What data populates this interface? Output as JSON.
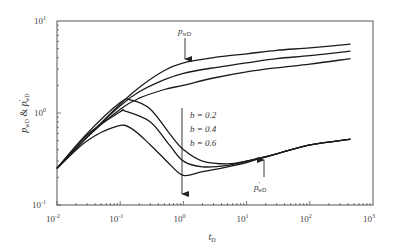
{
  "chart_data": {
    "type": "line",
    "title": "",
    "xlabel": "t_D",
    "ylabel": "p_wD & p'_wD",
    "xscale": "log",
    "yscale": "log",
    "xlim": [
      0.01,
      1000
    ],
    "ylim": [
      0.1,
      10
    ],
    "x_ticks": [
      "10^-2",
      "10^-1",
      "10^0",
      "10^1",
      "10^2",
      "10^3"
    ],
    "y_ticks": [
      "10^-1",
      "10^0",
      "10^1"
    ],
    "grid": false,
    "legend": "none",
    "annotations": [
      {
        "text": "p_wD",
        "points_to": "pressure curves (upper group)",
        "x": 0.8,
        "y": 3.7
      },
      {
        "text": "b = 0.2",
        "x": 1.1,
        "y": 1.35
      },
      {
        "text": "b = 0.4",
        "x": 1.1,
        "y": 1.0
      },
      {
        "text": "b = 0.6",
        "x": 1.1,
        "y": 0.75
      },
      {
        "text": "p'_wD",
        "points_to": "derivative curves (lower group)",
        "x": 20,
        "y": 0.32
      }
    ],
    "series": [
      {
        "name": "p_wD, b=0.2",
        "group": "pressure",
        "x": [
          0.01,
          0.03,
          0.1,
          0.2,
          0.5,
          1,
          3,
          10,
          30,
          100,
          440
        ],
        "y": [
          0.25,
          0.55,
          1.25,
          1.9,
          2.9,
          3.5,
          4.0,
          4.4,
          4.8,
          5.1,
          5.6
        ]
      },
      {
        "name": "p_wD, b=0.4",
        "group": "pressure",
        "x": [
          0.01,
          0.03,
          0.1,
          0.2,
          0.5,
          1,
          3,
          10,
          30,
          100,
          440
        ],
        "y": [
          0.25,
          0.55,
          1.2,
          1.7,
          2.3,
          2.7,
          3.1,
          3.5,
          3.9,
          4.2,
          4.7
        ]
      },
      {
        "name": "p_wD, b=0.6",
        "group": "pressure",
        "x": [
          0.01,
          0.03,
          0.1,
          0.2,
          0.5,
          1,
          3,
          10,
          30,
          100,
          440
        ],
        "y": [
          0.25,
          0.55,
          1.1,
          1.45,
          1.8,
          2.0,
          2.4,
          2.8,
          3.1,
          3.4,
          3.9
        ]
      },
      {
        "name": "p'_wD, b=0.2",
        "group": "derivative",
        "x": [
          0.01,
          0.03,
          0.1,
          0.15,
          0.3,
          0.6,
          1,
          2,
          5,
          10,
          30,
          100,
          440
        ],
        "y": [
          0.25,
          0.6,
          1.3,
          1.38,
          1.1,
          0.6,
          0.4,
          0.3,
          0.28,
          0.3,
          0.36,
          0.45,
          0.52
        ]
      },
      {
        "name": "p'_wD, b=0.4",
        "group": "derivative",
        "x": [
          0.01,
          0.03,
          0.1,
          0.12,
          0.3,
          0.6,
          1,
          2,
          5,
          10,
          30,
          100,
          440
        ],
        "y": [
          0.25,
          0.58,
          1.03,
          1.05,
          0.8,
          0.45,
          0.3,
          0.26,
          0.27,
          0.3,
          0.36,
          0.45,
          0.52
        ]
      },
      {
        "name": "p'_wD, b=0.6",
        "group": "derivative",
        "x": [
          0.01,
          0.03,
          0.09,
          0.15,
          0.3,
          0.6,
          1,
          2,
          5,
          10,
          30,
          100,
          440
        ],
        "y": [
          0.25,
          0.5,
          0.72,
          0.68,
          0.45,
          0.28,
          0.21,
          0.23,
          0.26,
          0.29,
          0.36,
          0.45,
          0.52
        ]
      }
    ]
  },
  "labels": {
    "x_axis_main": "t",
    "x_axis_sub": "D",
    "y_axis_p": "p",
    "y_axis_sub": "wD",
    "y_axis_amp": " & ",
    "y_axis_prime": "'",
    "x_tick_base": "10",
    "x_tick_exps": [
      "-2",
      "-1",
      "0",
      "1",
      "2",
      "3"
    ],
    "y_tick_exps": [
      "-1",
      "0",
      "1"
    ],
    "annot_pwd": "p",
    "annot_pwd_sub": "wD",
    "annot_b02": "b = 0.2",
    "annot_b04": "b = 0.4",
    "annot_b06": "b = 0.6",
    "annot_dpwd": "p",
    "annot_dpwd_prime": "'",
    "annot_dpwd_sub": "wD"
  }
}
